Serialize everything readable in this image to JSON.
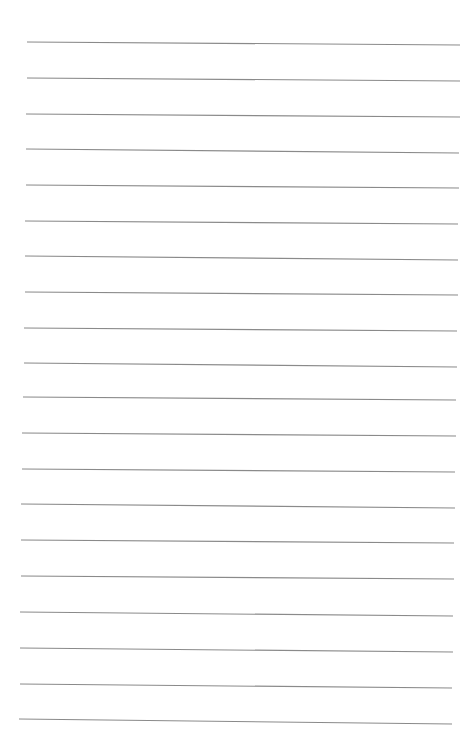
{
  "page": {
    "type": "lined-paper",
    "background_color": "#ffffff",
    "line_color": "#8a8a8a",
    "line_count": 20,
    "lines": [
      {
        "x1": 27,
        "y1": 42,
        "x2": 460,
        "y2": 45
      },
      {
        "x1": 27,
        "y1": 78,
        "x2": 460,
        "y2": 81
      },
      {
        "x1": 26,
        "y1": 114,
        "x2": 460,
        "y2": 117
      },
      {
        "x1": 26,
        "y1": 149,
        "x2": 459,
        "y2": 153
      },
      {
        "x1": 26,
        "y1": 185,
        "x2": 459,
        "y2": 188
      },
      {
        "x1": 25,
        "y1": 221,
        "x2": 458,
        "y2": 224
      },
      {
        "x1": 25,
        "y1": 256,
        "x2": 458,
        "y2": 260
      },
      {
        "x1": 25,
        "y1": 292,
        "x2": 458,
        "y2": 295
      },
      {
        "x1": 24,
        "y1": 328,
        "x2": 457,
        "y2": 331
      },
      {
        "x1": 24,
        "y1": 363,
        "x2": 457,
        "y2": 367
      },
      {
        "x1": 23,
        "y1": 397,
        "x2": 456,
        "y2": 400
      },
      {
        "x1": 22,
        "y1": 433,
        "x2": 456,
        "y2": 436
      },
      {
        "x1": 22,
        "y1": 469,
        "x2": 455,
        "y2": 472
      },
      {
        "x1": 21,
        "y1": 504,
        "x2": 455,
        "y2": 508
      },
      {
        "x1": 21,
        "y1": 540,
        "x2": 454,
        "y2": 543
      },
      {
        "x1": 21,
        "y1": 576,
        "x2": 454,
        "y2": 579
      },
      {
        "x1": 20,
        "y1": 612,
        "x2": 453,
        "y2": 616
      },
      {
        "x1": 20,
        "y1": 648,
        "x2": 453,
        "y2": 652
      },
      {
        "x1": 20,
        "y1": 684,
        "x2": 452,
        "y2": 688
      },
      {
        "x1": 19,
        "y1": 719,
        "x2": 452,
        "y2": 724
      }
    ]
  }
}
